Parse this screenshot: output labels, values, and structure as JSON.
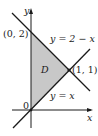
{
  "diagram": {
    "axes": {
      "x_label": "x",
      "y_label": "y"
    },
    "region_label": "D",
    "region_fill": "#c8c8c8",
    "line_color": "#1a1a1a",
    "points": [
      {
        "label": "(0, 2)"
      },
      {
        "label": "(1, 1)"
      },
      {
        "label": "0"
      }
    ],
    "lines": [
      {
        "label": "y = 2 − x"
      },
      {
        "label": "y = x"
      }
    ]
  }
}
